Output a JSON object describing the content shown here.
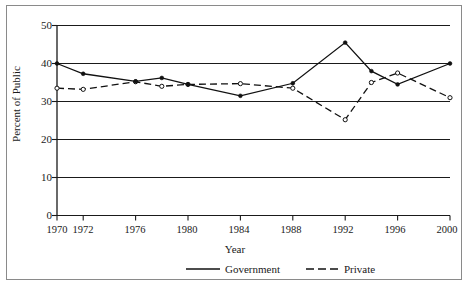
{
  "chart_data": {
    "type": "line",
    "title": "",
    "xlabel": "Year",
    "ylabel": "Percent of Public",
    "xlim": [
      1970,
      2000
    ],
    "ylim": [
      0,
      50
    ],
    "grid": true,
    "grid_axis": "y",
    "legend_position": "bottom",
    "xticks": [
      1970,
      1972,
      1976,
      1980,
      1984,
      1988,
      1992,
      1996,
      2000
    ],
    "xtick_labels": [
      "1970",
      "1972",
      "1976",
      "1980",
      "1984",
      "1988",
      "1992",
      "1996",
      "2000"
    ],
    "yticks": [
      0,
      10,
      20,
      30,
      40,
      50
    ],
    "ytick_labels": [
      "0",
      "10",
      "20",
      "30",
      "40",
      "50"
    ],
    "series": [
      {
        "name": "Government",
        "style": "solid",
        "marker": "filled-circle",
        "color": "#111111",
        "x": [
          1970,
          1972,
          1976,
          1978,
          1980,
          1984,
          1988,
          1992,
          1994,
          1996,
          2000
        ],
        "values": [
          40.0,
          37.3,
          35.3,
          36.2,
          34.5,
          31.5,
          34.8,
          45.5,
          38.0,
          34.5,
          40.0
        ]
      },
      {
        "name": "Private",
        "style": "dashed",
        "marker": "open-circle",
        "color": "#111111",
        "x": [
          1970,
          1972,
          1976,
          1978,
          1980,
          1984,
          1988,
          1992,
          1994,
          1996,
          2000
        ],
        "values": [
          33.5,
          33.2,
          35.2,
          34.0,
          34.5,
          34.7,
          33.5,
          25.2,
          35.0,
          37.5,
          31.0
        ]
      }
    ]
  },
  "legend": {
    "government_label": "Government",
    "private_label": "Private"
  },
  "axes": {
    "x_title": "Year",
    "y_title": "Percent of Public"
  }
}
